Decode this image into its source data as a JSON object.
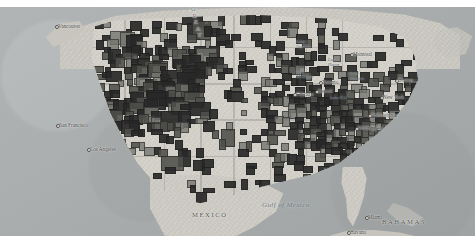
{
  "map": {
    "title": "United States county-level choropleth map",
    "projection": "conic",
    "basemap_style": "grayscale terrain",
    "colors": {
      "ocean": "#a8acac",
      "land": "#d2d0c8",
      "county_fill_dark": "#3d3d3d",
      "county_fill_mid": "#6e6e6a",
      "county_outline": "#1e1e1e"
    },
    "cities": [
      {
        "name": "Vancouver",
        "x": 58,
        "y": 24
      },
      {
        "name": "Montreal",
        "x": 353,
        "y": 52
      },
      {
        "name": "Toronto",
        "x": 322,
        "y": 80
      },
      {
        "name": "Detroit",
        "x": 318,
        "y": 89
      },
      {
        "name": "Chicago",
        "x": 296,
        "y": 92
      },
      {
        "name": "Boston",
        "x": 398,
        "y": 78
      },
      {
        "name": "New York",
        "x": 383,
        "y": 95
      },
      {
        "name": "Philadelphia",
        "x": 371,
        "y": 113
      },
      {
        "name": "Washington",
        "x": 358,
        "y": 126
      },
      {
        "name": "San Francisco",
        "x": 59,
        "y": 123
      },
      {
        "name": "Los Angeles",
        "x": 90,
        "y": 147
      },
      {
        "name": "Miami",
        "x": 368,
        "y": 215
      },
      {
        "name": "Havana",
        "x": 350,
        "y": 230
      }
    ],
    "lakes": [
      {
        "name": "Lake\nSuperior",
        "x": 296,
        "y": 40
      },
      {
        "name": "Lake\nHuron",
        "x": 328,
        "y": 58
      },
      {
        "name": "Lake\nMichigan",
        "x": 296,
        "y": 70
      },
      {
        "name": "Lake\nOntario",
        "x": 350,
        "y": 72
      },
      {
        "name": "Lake Erie",
        "x": 330,
        "y": 96
      }
    ],
    "water_bodies": [
      {
        "name": "Gulf of Mexico",
        "x": 262,
        "y": 202
      }
    ],
    "countries": [
      {
        "name": "MEXICO",
        "x": 192,
        "y": 212
      },
      {
        "name": "BAHAMAS",
        "x": 382,
        "y": 219
      }
    ],
    "regions": [
      {
        "name": "GREAT",
        "letters": [
          "G",
          "R",
          "E",
          "A",
          "T"
        ],
        "x": 191,
        "y": 6
      }
    ]
  }
}
